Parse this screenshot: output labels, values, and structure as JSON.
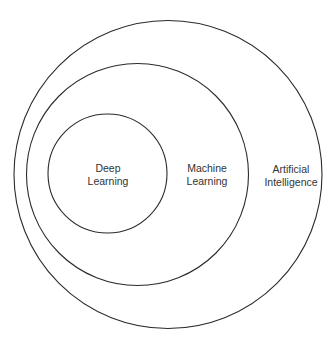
{
  "diagram": {
    "type": "nested-venn",
    "colors": {
      "stroke": "#2b2b2b",
      "text": "#333333",
      "background": "#ffffff"
    },
    "sets": [
      {
        "id": "ai",
        "label_lines": [
          "Artificial",
          "Intelligence"
        ],
        "cx": 168,
        "cy": 174,
        "r": 154
      },
      {
        "id": "ml",
        "label_lines": [
          "Machine",
          "Learning"
        ],
        "cx": 137,
        "cy": 175,
        "r": 111
      },
      {
        "id": "dl",
        "label_lines": [
          "Deep",
          "Learning"
        ],
        "cx": 108,
        "cy": 174,
        "r": 60
      }
    ]
  }
}
